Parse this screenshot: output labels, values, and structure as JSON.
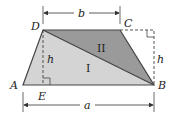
{
  "diagram": {
    "vertices": {
      "A": "A",
      "B": "B",
      "C": "C",
      "D": "D",
      "E": "E"
    },
    "dimensions": {
      "top_base": "b",
      "bottom_base": "a",
      "height_left": "h",
      "height_right": "h"
    },
    "regions": {
      "triangle_1": "I",
      "triangle_2": "II"
    },
    "colors": {
      "region_1_fill": "#d4d4d4",
      "region_2_fill": "#9a9a9a",
      "stroke": "#444444"
    }
  }
}
